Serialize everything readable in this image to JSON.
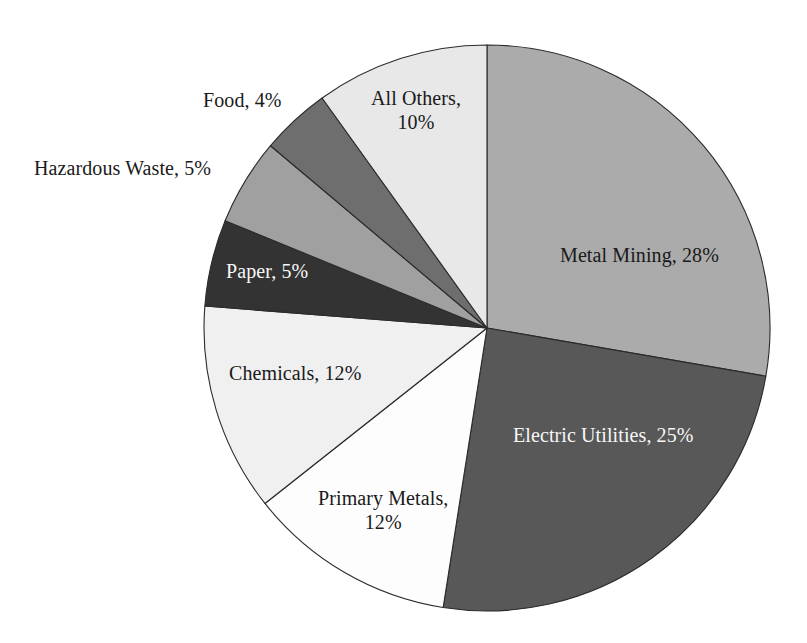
{
  "chart_data": {
    "type": "pie",
    "title": "",
    "subtitle": "",
    "xlabel": "",
    "ylabel": "",
    "legend_position": "none",
    "grid": false,
    "units": "percent",
    "start_angle_deg": 0,
    "direction": "clockwise",
    "categories": [
      "Metal Mining",
      "Electric Utilities",
      "Primary Metals",
      "Chemicals",
      "Paper",
      "Hazardous Waste",
      "Food",
      "All Others"
    ],
    "values": [
      28,
      25,
      12,
      12,
      5,
      5,
      4,
      10
    ],
    "slices": [
      {
        "label": "Metal Mining, 28%",
        "name": "Metal Mining",
        "value": 28,
        "color": "#ABABAB",
        "text_color": "#1a1a1a",
        "label_inside": true
      },
      {
        "label": "Electric Utilities, 25%",
        "name": "Electric Utilities",
        "value": 25,
        "color": "#585858",
        "text_color": "#f7f7f7",
        "label_inside": true
      },
      {
        "label": "Primary Metals,\n12%",
        "name": "Primary Metals",
        "value": 12,
        "color": "#FDFDFD",
        "text_color": "#1a1a1a",
        "label_inside": true
      },
      {
        "label": "Chemicals, 12%",
        "name": "Chemicals",
        "value": 12,
        "color": "#F0F0F0",
        "text_color": "#1a1a1a",
        "label_inside": true
      },
      {
        "label": "Paper, 5%",
        "name": "Paper",
        "value": 5,
        "color": "#333333",
        "text_color": "#f7f7f7",
        "label_inside": true
      },
      {
        "label": "Hazardous Waste, 5%",
        "name": "Hazardous Waste",
        "value": 5,
        "color": "#A0A0A0",
        "text_color": "#1a1a1a",
        "label_inside": false
      },
      {
        "label": "Food, 4%",
        "name": "Food",
        "value": 4,
        "color": "#6E6E6E",
        "text_color": "#1a1a1a",
        "label_inside": false
      },
      {
        "label": "All Others,\n10%",
        "name": "All Others",
        "value": 10,
        "color": "#E8E8E8",
        "text_color": "#1a1a1a",
        "label_inside": true
      }
    ],
    "geometry": {
      "center_x": 487,
      "center_y": 328,
      "radius": 283,
      "outline_color": "#2b2b2b"
    },
    "label_positions": [
      {
        "x": 560,
        "y": 243,
        "align": "left"
      },
      {
        "x": 513,
        "y": 423,
        "align": "left"
      },
      {
        "x": 318,
        "y": 486,
        "align": "center"
      },
      {
        "x": 229,
        "y": 361,
        "align": "left"
      },
      {
        "x": 226,
        "y": 259,
        "align": "left"
      },
      {
        "x": 34,
        "y": 156,
        "align": "left"
      },
      {
        "x": 203,
        "y": 88,
        "align": "left"
      },
      {
        "x": 371,
        "y": 86,
        "align": "center"
      }
    ]
  }
}
